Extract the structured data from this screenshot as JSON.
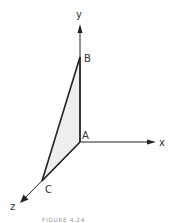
{
  "diagram": {
    "type": "3d-coordinate-axes-with-triangle",
    "axes": {
      "x": {
        "label": "x"
      },
      "y": {
        "label": "y"
      },
      "z": {
        "label": "z"
      }
    },
    "points": {
      "A": {
        "label": "A"
      },
      "B": {
        "label": "B"
      },
      "C": {
        "label": "C"
      }
    },
    "triangle": {
      "vertices": [
        "A",
        "B",
        "C"
      ],
      "fill": "#eeeeee",
      "stroke": "#222222"
    },
    "caption": "FIGURE 4.24"
  },
  "colors": {
    "line": "#222222",
    "triangle_fill": "#eeeeee",
    "label": "#333333",
    "background": "#ffffff"
  }
}
